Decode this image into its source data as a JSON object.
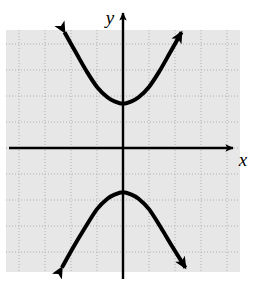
{
  "figure": {
    "name": "hyperbola-graph",
    "type": "coordinate-plane-graph",
    "width": 266,
    "height": 281,
    "background_color": "#ffffff"
  },
  "plot_area": {
    "fill_color": "#e7e7e7",
    "x": 6,
    "y": 30,
    "width": 234,
    "height": 242,
    "grid": {
      "visible": true,
      "style": "dotted",
      "color": "#b4b4b4",
      "spacing_px": 26,
      "x_lines": [
        19,
        45,
        71,
        97,
        123,
        149,
        175,
        201,
        227
      ],
      "y_lines": [
        44,
        70,
        96,
        122,
        148,
        174,
        200,
        226,
        252
      ]
    }
  },
  "axes": {
    "color": "#000000",
    "stroke_width": 2.4,
    "origin": {
      "x": 123,
      "y": 148
    },
    "x_axis": {
      "label": "x",
      "label_x": 243,
      "label_y": 166,
      "start_x": 9,
      "end_x": 233,
      "y": 148,
      "arrow": "right"
    },
    "y_axis": {
      "label": "y",
      "label_x": 110,
      "label_y": 24,
      "top_y": 13,
      "bottom_y": 279,
      "x": 123,
      "arrow": "up"
    }
  },
  "chart_data": {
    "type": "line",
    "title": "",
    "subtitle": "",
    "xlabel": "x",
    "ylabel": "y",
    "grid": true,
    "legend": "none",
    "curve_description": "Hyperbola with vertical transverse axis, centered at the origin, opening upward and downward",
    "curve_color": "#000000",
    "curve_stroke_width": 4,
    "arrowheads": "both ends of each branch",
    "units_per_grid": 1,
    "xlim": [
      -4.5,
      4.2
    ],
    "ylim": [
      -4.8,
      4.5
    ],
    "center": {
      "x": 0,
      "y": 0
    },
    "vertices": [
      {
        "x": 0,
        "y": 1.7
      },
      {
        "x": 0,
        "y": -1.7
      }
    ],
    "asymptote_slopes": [
      1.4,
      -1.4
    ],
    "branches": [
      {
        "name": "upper-branch",
        "vertex_px": {
          "x": 123,
          "y": 104
        },
        "left_endpoint_px": {
          "x": 65,
          "y": 28
        },
        "right_endpoint_px": {
          "x": 183,
          "y": 28
        },
        "opens": "up"
      },
      {
        "name": "lower-branch",
        "vertex_px": {
          "x": 123,
          "y": 192
        },
        "left_endpoint_px": {
          "x": 62,
          "y": 268
        },
        "right_endpoint_px": {
          "x": 185,
          "y": 268
        },
        "opens": "down"
      }
    ],
    "series": [
      {
        "name": "upper-branch",
        "x": [
          -2.25,
          -1.8,
          -1.4,
          -1.0,
          -0.6,
          -0.3,
          0,
          0.3,
          0.6,
          1.0,
          1.4,
          1.8,
          2.25
        ],
        "y": [
          4.45,
          3.65,
          2.95,
          2.35,
          1.95,
          1.78,
          1.7,
          1.78,
          1.95,
          2.35,
          2.95,
          3.65,
          4.45
        ]
      },
      {
        "name": "lower-branch",
        "x": [
          -2.35,
          -1.9,
          -1.45,
          -1.0,
          -0.6,
          -0.3,
          0,
          0.3,
          0.6,
          1.0,
          1.45,
          1.9,
          2.4
        ],
        "y": [
          -4.6,
          -3.8,
          -3.05,
          -2.35,
          -1.95,
          -1.78,
          -1.7,
          -1.78,
          -1.95,
          -2.35,
          -3.05,
          -3.8,
          -4.6
        ]
      }
    ]
  }
}
